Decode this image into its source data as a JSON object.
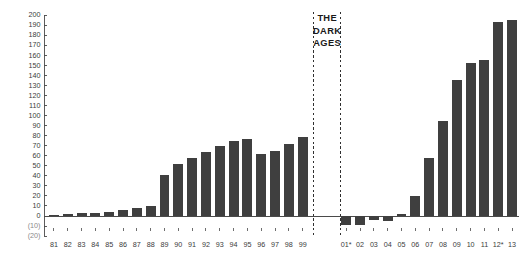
{
  "chart_data": {
    "type": "bar",
    "title": "",
    "xlabel": "",
    "ylabel": "",
    "ylim": [
      -20,
      200
    ],
    "grid": false,
    "legend": null,
    "categories": [
      "81",
      "82",
      "83",
      "84",
      "85",
      "86",
      "87",
      "88",
      "89",
      "90",
      "91",
      "92",
      "93",
      "94",
      "95",
      "96",
      "97",
      "98",
      "99",
      "01*",
      "02",
      "03",
      "04",
      "05",
      "06",
      "07",
      "08",
      "09",
      "10",
      "11",
      "12*",
      "13"
    ],
    "values": [
      1,
      1.5,
      2.5,
      3,
      4,
      5.5,
      7.5,
      10,
      41,
      52,
      58,
      64,
      70,
      75,
      77,
      62,
      65,
      72,
      79,
      -9,
      -9,
      -4,
      -5,
      2,
      20,
      58,
      95,
      135,
      152,
      155,
      193,
      195
    ],
    "ytick_labels": [
      "200",
      "190",
      "180",
      "170",
      "160",
      "150",
      "140",
      "130",
      "120",
      "110",
      "100",
      "90",
      "80",
      "70",
      "60",
      "50",
      "40",
      "30",
      "20",
      "10",
      "0",
      "(10)",
      "(20)"
    ],
    "ytick_values": [
      200,
      190,
      180,
      170,
      160,
      150,
      140,
      130,
      120,
      110,
      100,
      90,
      80,
      70,
      60,
      50,
      40,
      30,
      20,
      10,
      0,
      -10,
      -20
    ],
    "annotations": [
      {
        "name": "dark-ages-label",
        "lines": [
          "THE",
          "DARK",
          "AGES"
        ]
      }
    ],
    "gap_markers": [
      {
        "name": "dark-ages-start-divider",
        "after_category": "99"
      },
      {
        "name": "dark-ages-end-divider",
        "after_category": "04"
      }
    ],
    "colors": {
      "bar": "#3f3f3f",
      "axis": "#4a4a4a",
      "tick_label": "#3b3b3b",
      "negative_tick_label": "#8b8b8b",
      "divider": "#1a1a1a",
      "background": "#ffffff"
    }
  }
}
